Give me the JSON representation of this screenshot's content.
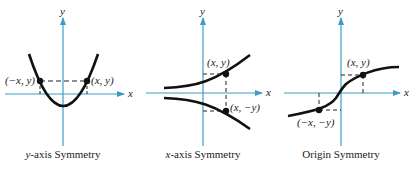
{
  "colors": {
    "axis": "#3d9cc4",
    "curve": "#111111",
    "text": "#222222",
    "dash": "#222222"
  },
  "panels": [
    {
      "caption_var": "y",
      "caption_rest": "-axis Symmetry",
      "x_axis_label": "x",
      "y_axis_label": "y",
      "points": [
        {
          "label": "(−x, y)"
        },
        {
          "label": "(x, y)"
        }
      ]
    },
    {
      "caption_var": "x",
      "caption_rest": "-axis Symmetry",
      "x_axis_label": "x",
      "y_axis_label": "y",
      "points": [
        {
          "label": "(x, y)"
        },
        {
          "label": "(x, −y)"
        }
      ]
    },
    {
      "caption_var": "",
      "caption_rest": "Origin Symmetry",
      "x_axis_label": "x",
      "y_axis_label": "y",
      "points": [
        {
          "label": "(x, y)"
        },
        {
          "label": "(−x, −y)"
        }
      ]
    }
  ]
}
